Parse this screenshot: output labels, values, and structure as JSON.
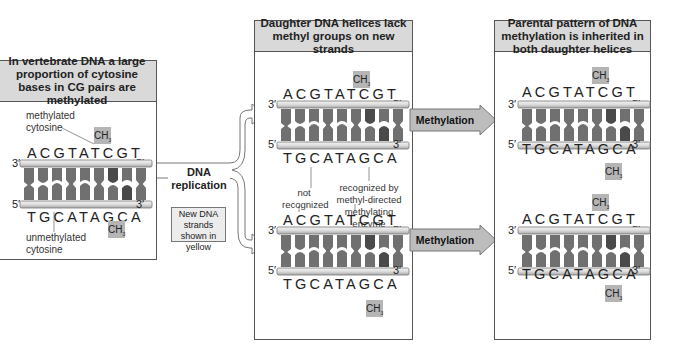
{
  "panels": {
    "left": {
      "title": "In vertebrate DNA a large proportion of cytosine bases in CG pairs are methylated",
      "top_seq": "ACGTATCGT",
      "bottom_seq": "TGCATAGCA",
      "top_left_end": "3′",
      "top_right_end": "5′",
      "bottom_left_end": "5′",
      "bottom_right_end": "3′",
      "label_methylated": "methylated cytosine",
      "label_unmethylated": "unmethylated cytosine",
      "methyl": "CH"
    },
    "middle": {
      "title": "Daughter DNA helices lack methyl groups on new strands",
      "helix1": {
        "top_seq": "ACGTATCGT",
        "bottom_seq": "TGCATAGCA",
        "methyl_top": "CH"
      },
      "helix2": {
        "top_seq": "ACGTATCGT",
        "bottom_seq": "TGCATAGCA",
        "methyl_bottom": "CH"
      },
      "label_not_recognized": "not recognized",
      "label_recognized": "recognized by methyl-directed methylating enzyme",
      "ends": {
        "three": "3′",
        "five": "5′"
      }
    },
    "right": {
      "title": "Parental pattern of DNA methylation is inherited in both daughter helices",
      "helix1": {
        "top_seq": "ACGTATCGT",
        "bottom_seq": "TGCATAGCA"
      },
      "helix2": {
        "top_seq": "ACGTATCGT",
        "bottom_seq": "TGCATAGCA"
      },
      "methyl": "CH",
      "ends": {
        "three": "3′",
        "five": "5′"
      }
    }
  },
  "replication": {
    "label": "DNA replication",
    "note": "New DNA strands shown in yellow"
  },
  "arrows": {
    "methylation_top": "Methylation",
    "methylation_bottom": "Methylation"
  },
  "colors": {
    "header_bg": "#d9d9d9",
    "strand": "#e6e6e6",
    "base": "#6f6f6f",
    "base_dark": "#4a4a4a",
    "methyl_bg": "#b5b5b5",
    "arrow_fill": "#bdbdbd"
  }
}
